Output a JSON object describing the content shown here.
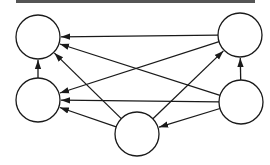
{
  "diagram": {
    "type": "directed-graph",
    "stroke_color": "#1a1a1a",
    "node_fill": "#ffffff",
    "border_color": "#555555",
    "node_radius": 22,
    "nodes": [
      {
        "id": "A",
        "label": "",
        "position": "top-left",
        "cx": 38,
        "cy": 37
      },
      {
        "id": "B",
        "label": "",
        "position": "top-right",
        "cx": 240,
        "cy": 35
      },
      {
        "id": "C",
        "label": "",
        "position": "middle-left",
        "cx": 38,
        "cy": 100
      },
      {
        "id": "D",
        "label": "",
        "position": "middle-right",
        "cx": 241,
        "cy": 102
      },
      {
        "id": "E",
        "label": "",
        "position": "bottom-center",
        "cx": 137,
        "cy": 134
      }
    ],
    "edges": [
      {
        "from": "B",
        "to": "A"
      },
      {
        "from": "D",
        "to": "A"
      },
      {
        "from": "E",
        "to": "A"
      },
      {
        "from": "C",
        "to": "A"
      },
      {
        "from": "B",
        "to": "C"
      },
      {
        "from": "D",
        "to": "C"
      },
      {
        "from": "E",
        "to": "C"
      },
      {
        "from": "E",
        "to": "B"
      },
      {
        "from": "D",
        "to": "B"
      },
      {
        "from": "D",
        "to": "E"
      }
    ]
  }
}
